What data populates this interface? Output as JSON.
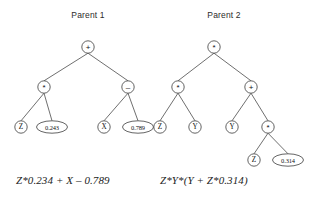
{
  "figure": {
    "background_color": "#ffffff",
    "stroke_color": "#3c3c3c",
    "edge_color": "#4a4a4a",
    "text_color": "#1a1a1a"
  },
  "trees": [
    {
      "id": "parent-1",
      "title": "Parent 1",
      "equation": "Z*0.234 + X – 0.789",
      "nodes": [
        {
          "id": "p1-root",
          "label": "+",
          "kind": "operator",
          "shape": "circle",
          "cx": 88,
          "cy": 47,
          "r": 6.2
        },
        {
          "id": "p1-n2",
          "label": "*",
          "kind": "operator",
          "shape": "circle",
          "cx": 44,
          "cy": 87,
          "r": 6.2
        },
        {
          "id": "p1-n3",
          "label": "–",
          "kind": "operator",
          "shape": "circle",
          "cx": 128,
          "cy": 87,
          "r": 6.2
        },
        {
          "id": "p1-n4",
          "label": "Z",
          "kind": "variable",
          "shape": "circle",
          "cx": 21,
          "cy": 127,
          "r": 6.2
        },
        {
          "id": "p1-n5",
          "label": "0.243",
          "kind": "constant",
          "shape": "ellipse",
          "cx": 52,
          "cy": 127,
          "rx": 15.5,
          "ry": 6.2
        },
        {
          "id": "p1-n6",
          "label": "X",
          "kind": "variable",
          "shape": "circle",
          "cx": 104,
          "cy": 127,
          "r": 6.2
        },
        {
          "id": "p1-n7",
          "label": "0.789",
          "kind": "constant",
          "shape": "ellipse",
          "cx": 138,
          "cy": 127,
          "rx": 15.5,
          "ry": 6.2
        }
      ],
      "edges": [
        {
          "from": "p1-root",
          "to": "p1-n2"
        },
        {
          "from": "p1-root",
          "to": "p1-n3"
        },
        {
          "from": "p1-n2",
          "to": "p1-n4"
        },
        {
          "from": "p1-n2",
          "to": "p1-n5"
        },
        {
          "from": "p1-n3",
          "to": "p1-n6"
        },
        {
          "from": "p1-n3",
          "to": "p1-n7"
        }
      ]
    },
    {
      "id": "parent-2",
      "title": "Parent 2",
      "equation": "Z*Y*(Y + Z*0.314)",
      "nodes": [
        {
          "id": "p2-root",
          "label": "*",
          "kind": "operator",
          "shape": "circle",
          "cx": 214,
          "cy": 47,
          "r": 6.2
        },
        {
          "id": "p2-n2",
          "label": "*",
          "kind": "operator",
          "shape": "circle",
          "cx": 178,
          "cy": 87,
          "r": 6.2
        },
        {
          "id": "p2-n3",
          "label": "+",
          "kind": "operator",
          "shape": "circle",
          "cx": 251,
          "cy": 87,
          "r": 6.2
        },
        {
          "id": "p2-n4",
          "label": "Z",
          "kind": "variable",
          "shape": "circle",
          "cx": 160,
          "cy": 127,
          "r": 6.2
        },
        {
          "id": "p2-n5",
          "label": "Y",
          "kind": "variable",
          "shape": "circle",
          "cx": 195,
          "cy": 127,
          "r": 6.2
        },
        {
          "id": "p2-n6",
          "label": "Y",
          "kind": "variable",
          "shape": "circle",
          "cx": 232,
          "cy": 127,
          "r": 6.2
        },
        {
          "id": "p2-n7",
          "label": "*",
          "kind": "operator",
          "shape": "circle",
          "cx": 268,
          "cy": 127,
          "r": 6.2
        },
        {
          "id": "p2-n8",
          "label": "Z",
          "kind": "variable",
          "shape": "circle",
          "cx": 254,
          "cy": 160,
          "r": 6.2
        },
        {
          "id": "p2-n9",
          "label": "0.314",
          "kind": "constant",
          "shape": "ellipse",
          "cx": 288,
          "cy": 160,
          "rx": 15.5,
          "ry": 6.2
        }
      ],
      "edges": [
        {
          "from": "p2-root",
          "to": "p2-n2"
        },
        {
          "from": "p2-root",
          "to": "p2-n3"
        },
        {
          "from": "p2-n2",
          "to": "p2-n4"
        },
        {
          "from": "p2-n2",
          "to": "p2-n5"
        },
        {
          "from": "p2-n3",
          "to": "p2-n6"
        },
        {
          "from": "p2-n3",
          "to": "p2-n7"
        },
        {
          "from": "p2-n7",
          "to": "p2-n8"
        },
        {
          "from": "p2-n7",
          "to": "p2-n9"
        }
      ]
    }
  ]
}
